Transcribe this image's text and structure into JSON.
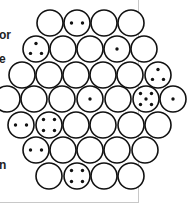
{
  "text_fragments": [
    {
      "text": "or",
      "y": 29
    },
    {
      "text": "e",
      "y": 53
    },
    {
      "text": "n",
      "y": 159
    }
  ],
  "diagram": {
    "circle_radius": 13,
    "stroke_color": "#111111",
    "fill_color": "#ffffff",
    "dot_color": "#111111",
    "rows": [
      {
        "y": 23,
        "cells": [
          {
            "x": 50,
            "dots": 0
          },
          {
            "x": 77,
            "dots": 2
          },
          {
            "x": 104,
            "dots": 0
          },
          {
            "x": 131,
            "dots": 0
          }
        ]
      },
      {
        "y": 49,
        "cells": [
          {
            "x": 36,
            "dots": 3
          },
          {
            "x": 63,
            "dots": 0
          },
          {
            "x": 90,
            "dots": 0
          },
          {
            "x": 117,
            "dots": 1
          },
          {
            "x": 144,
            "dots": 0
          }
        ]
      },
      {
        "y": 75,
        "cells": [
          {
            "x": 22,
            "dots": 0
          },
          {
            "x": 49,
            "dots": 0
          },
          {
            "x": 76,
            "dots": 0
          },
          {
            "x": 103,
            "dots": 0
          },
          {
            "x": 130,
            "dots": 0
          },
          {
            "x": 158,
            "dots": 3
          }
        ]
      },
      {
        "y": 99,
        "cells": [
          {
            "x": 7,
            "dots": 0
          },
          {
            "x": 34,
            "dots": 0
          },
          {
            "x": 62,
            "dots": 0
          },
          {
            "x": 90,
            "dots": 1
          },
          {
            "x": 118,
            "dots": 0
          },
          {
            "x": 146,
            "dots": 5
          },
          {
            "x": 173,
            "dots": 1
          }
        ]
      },
      {
        "y": 125,
        "cells": [
          {
            "x": 21,
            "dots": 2
          },
          {
            "x": 49,
            "dots": 4
          },
          {
            "x": 76,
            "dots": 0
          },
          {
            "x": 103,
            "dots": 0
          },
          {
            "x": 131,
            "dots": 0
          },
          {
            "x": 158,
            "dots": 0
          }
        ]
      },
      {
        "y": 150,
        "cells": [
          {
            "x": 36,
            "dots": 2
          },
          {
            "x": 63,
            "dots": 0
          },
          {
            "x": 90,
            "dots": 0
          },
          {
            "x": 117,
            "dots": 0
          },
          {
            "x": 145,
            "dots": 0
          }
        ]
      },
      {
        "y": 176,
        "cells": [
          {
            "x": 49,
            "dots": 0
          },
          {
            "x": 77,
            "dots": 4
          },
          {
            "x": 104,
            "dots": 0
          },
          {
            "x": 131,
            "dots": 0
          }
        ]
      }
    ]
  }
}
